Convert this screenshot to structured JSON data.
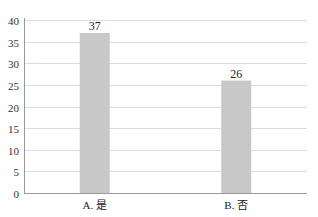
{
  "chart_data": {
    "type": "bar",
    "title": "",
    "xlabel": "",
    "ylabel": "",
    "categories": [
      "A. 是",
      "B. 否"
    ],
    "values": [
      37,
      26
    ],
    "ylim": [
      0,
      40
    ],
    "yticks": [
      0,
      5,
      10,
      15,
      20,
      25,
      30,
      35,
      40
    ],
    "grid": true,
    "legend": null,
    "data_labels": [
      "37",
      "26"
    ],
    "colors": {
      "bar": "#c8c8c8",
      "grid": "#dddddd",
      "axis": "#999999"
    }
  }
}
